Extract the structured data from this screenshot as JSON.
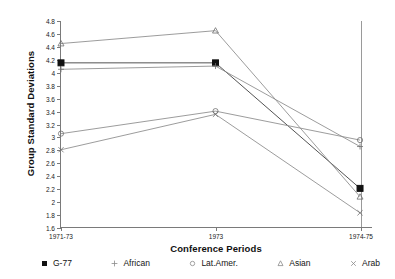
{
  "chart_data": {
    "type": "line",
    "title": "",
    "xlabel": "Conference Periods",
    "ylabel": "Group Standard Deviations",
    "categories": [
      "1971-73",
      "1973",
      "1974-75"
    ],
    "ylim": [
      1.6,
      4.8
    ],
    "ytick_step": 0.2,
    "yticks": [
      "4.8",
      "4.6",
      "4.4",
      "4.2",
      "4",
      "3.8",
      "3.6",
      "3.4",
      "3.2",
      "3",
      "2.8",
      "2.6",
      "2.4",
      "2.2",
      "2",
      "1.8",
      "1.6"
    ],
    "grid": false,
    "legend_position": "bottom",
    "series": [
      {
        "name": "G-77",
        "marker": "filled-square",
        "color": "#1a1a1a",
        "values": [
          4.15,
          4.15,
          2.2
        ]
      },
      {
        "name": "African",
        "marker": "plus",
        "color": "#6e6e6e",
        "values": [
          4.05,
          4.1,
          2.85
        ]
      },
      {
        "name": "Lat.Amer.",
        "marker": "open-circle",
        "color": "#6e6e6e",
        "values": [
          3.05,
          3.4,
          2.95
        ]
      },
      {
        "name": "Asian",
        "marker": "open-triangle",
        "color": "#6e6e6e",
        "values": [
          4.45,
          4.65,
          2.07
        ]
      },
      {
        "name": "Arab",
        "marker": "cross",
        "color": "#6e6e6e",
        "values": [
          2.8,
          3.35,
          1.82
        ]
      }
    ]
  },
  "legend": {
    "items": [
      {
        "label": "G-77",
        "marker": "filled-square-marker"
      },
      {
        "label": "African",
        "marker": "plus-marker"
      },
      {
        "label": "Lat.Amer.",
        "marker": "open-circle-marker"
      },
      {
        "label": "Asian",
        "marker": "open-triangle-marker"
      },
      {
        "label": "Arab",
        "marker": "cross-marker"
      }
    ]
  },
  "axes": {
    "x_title": "Conference Periods",
    "y_title": "Group Standard Deviations"
  }
}
